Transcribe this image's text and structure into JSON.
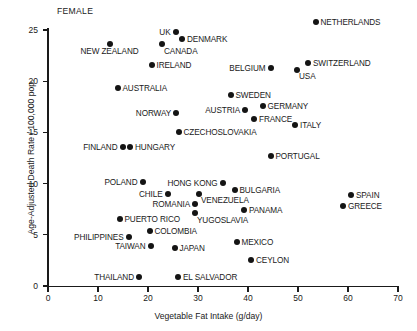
{
  "chart_data": {
    "type": "scatter",
    "title": "",
    "panel_label": "FEMALE",
    "xlabel": "Vegetable Fat Intake (g/day)",
    "ylabel": "Age-Adjusted Death Rate / 100,000 pop.",
    "xlim": [
      0,
      70
    ],
    "ylim": [
      0,
      25
    ],
    "xticks": [
      0,
      10,
      20,
      30,
      40,
      50,
      60,
      70
    ],
    "yticks": [
      0,
      5,
      10,
      15,
      20,
      25
    ],
    "xtick_labels": [
      "0",
      "10",
      "20",
      "30",
      "40",
      "50",
      "60",
      "70"
    ],
    "ytick_labels": [
      "0",
      "5",
      "10",
      "15",
      "20",
      "25"
    ],
    "grid": false,
    "legend": "none",
    "marker_color": "#141414",
    "axis_color": "#1a1a1a",
    "points": [
      {
        "label": "NETHERLANDS",
        "x": 53.5,
        "y": 25.8,
        "side": "right"
      },
      {
        "label": "UK",
        "x": 25.5,
        "y": 24.8,
        "side": "left"
      },
      {
        "label": "DENMARK",
        "x": 26.8,
        "y": 24.1,
        "side": "right"
      },
      {
        "label": "CANADA",
        "x": 22.8,
        "y": 23.6,
        "side": "rightbelow"
      },
      {
        "label": "NEW ZEALAND",
        "x": 12.3,
        "y": 23.6,
        "side": "centerbelow"
      },
      {
        "label": "SWITZERLAND",
        "x": 52.0,
        "y": 21.8,
        "side": "right"
      },
      {
        "label": "IRELAND",
        "x": 20.7,
        "y": 21.6,
        "side": "right"
      },
      {
        "label": "BELGIUM",
        "x": 44.5,
        "y": 21.3,
        "side": "left"
      },
      {
        "label": "USA",
        "x": 49.8,
        "y": 21.1,
        "side": "rightbelow"
      },
      {
        "label": "AUSTRALIA",
        "x": 13.9,
        "y": 19.3,
        "side": "right"
      },
      {
        "label": "SWEDEN",
        "x": 36.5,
        "y": 18.7,
        "side": "right"
      },
      {
        "label": "GERMANY",
        "x": 42.9,
        "y": 17.6,
        "side": "right"
      },
      {
        "label": "AUSTRIA",
        "x": 39.4,
        "y": 17.2,
        "side": "left"
      },
      {
        "label": "NORWAY",
        "x": 25.6,
        "y": 16.9,
        "side": "left"
      },
      {
        "label": "FRANCE",
        "x": 41.2,
        "y": 16.3,
        "side": "right"
      },
      {
        "label": "ITALY",
        "x": 49.4,
        "y": 15.7,
        "side": "right"
      },
      {
        "label": "CZECHOSLOVAKIA",
        "x": 26.1,
        "y": 15.0,
        "side": "right"
      },
      {
        "label": "FINLAND",
        "x": 14.9,
        "y": 13.6,
        "side": "left"
      },
      {
        "label": "HUNGARY",
        "x": 16.4,
        "y": 13.6,
        "side": "right"
      },
      {
        "label": "PORTUGAL",
        "x": 44.5,
        "y": 12.7,
        "side": "right"
      },
      {
        "label": "HONG KONG",
        "x": 34.9,
        "y": 10.1,
        "side": "left"
      },
      {
        "label": "POLAND",
        "x": 18.9,
        "y": 10.2,
        "side": "left"
      },
      {
        "label": "BULGARIA",
        "x": 37.3,
        "y": 9.4,
        "side": "right"
      },
      {
        "label": "CHILE",
        "x": 23.9,
        "y": 9.0,
        "side": "left"
      },
      {
        "label": "VENEZUELA",
        "x": 30.2,
        "y": 9.0,
        "side": "rightbelow"
      },
      {
        "label": "SPAIN",
        "x": 60.6,
        "y": 8.9,
        "side": "right"
      },
      {
        "label": "ROMANIA",
        "x": 29.4,
        "y": 8.0,
        "side": "left"
      },
      {
        "label": "GREECE",
        "x": 59.0,
        "y": 7.8,
        "side": "right"
      },
      {
        "label": "PANAMA",
        "x": 39.2,
        "y": 7.4,
        "side": "right"
      },
      {
        "label": "YUGOSLAVIA",
        "x": 29.4,
        "y": 7.1,
        "side": "rightbelow"
      },
      {
        "label": "PUERTO RICO",
        "x": 14.3,
        "y": 6.5,
        "side": "right"
      },
      {
        "label": "COLOMBIA",
        "x": 20.3,
        "y": 5.4,
        "side": "right"
      },
      {
        "label": "PHILIPPINES",
        "x": 16.1,
        "y": 4.8,
        "side": "left"
      },
      {
        "label": "MEXICO",
        "x": 37.7,
        "y": 4.3,
        "side": "right"
      },
      {
        "label": "TAIWAN",
        "x": 20.5,
        "y": 3.9,
        "side": "left"
      },
      {
        "label": "JAPAN",
        "x": 25.3,
        "y": 3.7,
        "side": "right"
      },
      {
        "label": "CEYLON",
        "x": 40.6,
        "y": 2.5,
        "side": "right"
      },
      {
        "label": "THAILAND",
        "x": 18.2,
        "y": 0.9,
        "side": "left"
      },
      {
        "label": "EL SALVADOR",
        "x": 26.0,
        "y": 0.9,
        "side": "right"
      }
    ]
  }
}
